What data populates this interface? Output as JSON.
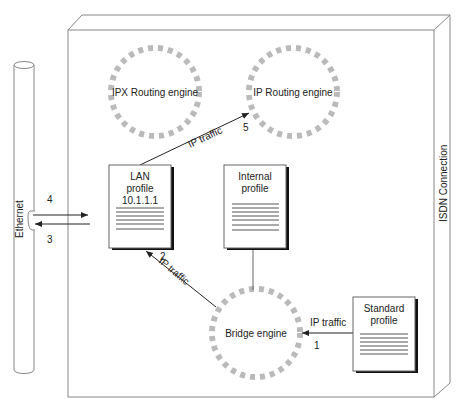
{
  "diagram": {
    "container": {
      "label": "ISDN Connection"
    },
    "ethernet": {
      "label": "Ethernet"
    },
    "engines": [
      {
        "id": "ipx",
        "label": "IPX Routing engine"
      },
      {
        "id": "ip",
        "label": "IP Routing engine"
      },
      {
        "id": "bridge",
        "label": "Bridge engine"
      }
    ],
    "profiles": [
      {
        "id": "lan",
        "line1": "LAN",
        "line2": "profile",
        "line3": "10.1.1.1"
      },
      {
        "id": "internal",
        "line1": "Internal",
        "line2": "profile"
      },
      {
        "id": "standard",
        "line1": "Standard",
        "line2": "profile"
      }
    ],
    "flows": [
      {
        "label": "IP traffic",
        "step": "1"
      },
      {
        "label": "IP traffic",
        "step": "2"
      },
      {
        "label": "IP traffic",
        "step": "5"
      }
    ],
    "ethernet_steps": {
      "out": "4",
      "in": "3"
    }
  }
}
